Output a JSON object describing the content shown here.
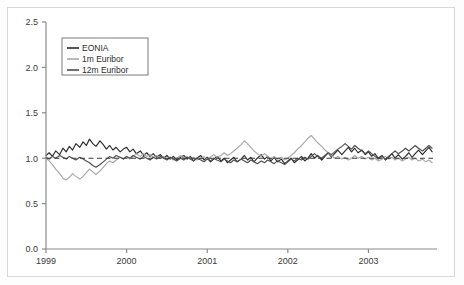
{
  "chart_data": {
    "type": "line",
    "title": "",
    "subtitle": "",
    "xlabel": "",
    "ylabel": "",
    "xlim": [
      1999.0,
      2003.85
    ],
    "ylim": [
      0.0,
      2.5
    ],
    "grid": false,
    "legend_position": "top-left",
    "x_tick_labels": [
      "1999",
      "2000",
      "2001",
      "2002",
      "2003"
    ],
    "x_tick_values": [
      1999,
      2000,
      2001,
      2002,
      2003
    ],
    "y_tick_labels": [
      "0.0",
      "0.5",
      "1.0",
      "1.5",
      "2.0",
      "2.5"
    ],
    "y_tick_values": [
      0.0,
      0.5,
      1.0,
      1.5,
      2.0,
      2.5
    ],
    "reference_line": {
      "name": "unity-reference",
      "value": 1.0,
      "style": "dashed",
      "color": "#3a3a3a"
    },
    "colors": {
      "eonia": "#2b2b2b",
      "euribor_1m": "#a8a8a8",
      "euribor_12m": "#4e4e4e",
      "axis": "#8a8a8a",
      "text": "#3a3a3a",
      "legend_border": "#6e6e6e",
      "frame": "#d8d8d8",
      "background": "#ffffff"
    },
    "series": [
      {
        "name": "EONIA",
        "legend_label": "EONIA",
        "color": "#2b2b2b",
        "x": [
          1999.0,
          1999.04,
          1999.08,
          1999.12,
          1999.17,
          1999.21,
          1999.25,
          1999.29,
          1999.33,
          1999.37,
          1999.42,
          1999.46,
          1999.5,
          1999.54,
          1999.58,
          1999.62,
          1999.67,
          1999.71,
          1999.75,
          1999.79,
          1999.83,
          1999.87,
          1999.92,
          1999.96,
          2000.0,
          2000.04,
          2000.08,
          2000.12,
          2000.17,
          2000.21,
          2000.25,
          2000.29,
          2000.33,
          2000.37,
          2000.42,
          2000.46,
          2000.5,
          2000.54,
          2000.58,
          2000.62,
          2000.67,
          2000.71,
          2000.75,
          2000.79,
          2000.83,
          2000.87,
          2000.92,
          2000.96,
          2001.0,
          2001.04,
          2001.08,
          2001.12,
          2001.17,
          2001.21,
          2001.25,
          2001.29,
          2001.33,
          2001.37,
          2001.42,
          2001.46,
          2001.5,
          2001.54,
          2001.58,
          2001.62,
          2001.67,
          2001.71,
          2001.75,
          2001.79,
          2001.83,
          2001.87,
          2001.92,
          2001.96,
          2002.0,
          2002.04,
          2002.08,
          2002.12,
          2002.17,
          2002.21,
          2002.25,
          2002.29,
          2002.33,
          2002.37,
          2002.42,
          2002.46,
          2002.5,
          2002.54,
          2002.58,
          2002.62,
          2002.67,
          2002.71,
          2002.75,
          2002.79,
          2002.83,
          2002.87,
          2002.92,
          2002.96,
          2003.0,
          2003.04,
          2003.08,
          2003.12,
          2003.17,
          2003.21,
          2003.25,
          2003.29,
          2003.33,
          2003.37,
          2003.42,
          2003.46,
          2003.5,
          2003.54,
          2003.58,
          2003.62,
          2003.67,
          2003.71,
          2003.75,
          2003.79
        ],
        "y": [
          1.03,
          1.06,
          1.02,
          1.08,
          1.04,
          1.11,
          1.07,
          1.13,
          1.09,
          1.16,
          1.12,
          1.18,
          1.14,
          1.21,
          1.16,
          1.13,
          1.19,
          1.15,
          1.1,
          1.14,
          1.09,
          1.12,
          1.07,
          1.1,
          1.12,
          1.07,
          1.1,
          1.05,
          1.08,
          1.03,
          1.06,
          1.02,
          1.05,
          1.01,
          1.04,
          1.0,
          1.03,
          0.99,
          1.02,
          0.98,
          1.01,
          1.03,
          0.99,
          1.02,
          0.97,
          1.0,
          1.03,
          0.98,
          1.01,
          0.96,
          0.99,
          1.02,
          0.97,
          1.0,
          0.95,
          0.98,
          1.01,
          0.96,
          0.99,
          1.03,
          0.98,
          1.01,
          0.96,
          1.0,
          1.04,
          0.99,
          1.02,
          0.97,
          1.01,
          0.96,
          0.99,
          0.94,
          0.97,
          1.0,
          0.95,
          0.98,
          1.02,
          0.97,
          1.0,
          1.05,
          1.0,
          1.03,
          0.98,
          1.02,
          1.06,
          1.01,
          1.05,
          1.09,
          1.04,
          1.08,
          1.12,
          1.07,
          1.11,
          1.06,
          1.09,
          1.04,
          1.07,
          1.02,
          1.05,
          1.0,
          1.03,
          0.98,
          1.01,
          1.05,
          1.0,
          1.04,
          0.99,
          1.02,
          1.06,
          1.01,
          1.05,
          1.09,
          1.04,
          1.08,
          1.12,
          1.07
        ]
      },
      {
        "name": "1m Euribor",
        "legend_label": "1m Euribor",
        "color": "#a8a8a8",
        "x": [
          1999.0,
          1999.04,
          1999.08,
          1999.12,
          1999.17,
          1999.21,
          1999.25,
          1999.29,
          1999.33,
          1999.37,
          1999.42,
          1999.46,
          1999.5,
          1999.54,
          1999.58,
          1999.62,
          1999.67,
          1999.71,
          1999.75,
          1999.79,
          1999.83,
          1999.87,
          1999.92,
          1999.96,
          2000.0,
          2000.04,
          2000.08,
          2000.12,
          2000.17,
          2000.21,
          2000.25,
          2000.29,
          2000.33,
          2000.37,
          2000.42,
          2000.46,
          2000.5,
          2000.54,
          2000.58,
          2000.62,
          2000.67,
          2000.71,
          2000.75,
          2000.79,
          2000.83,
          2000.87,
          2000.92,
          2000.96,
          2001.0,
          2001.04,
          2001.08,
          2001.12,
          2001.17,
          2001.21,
          2001.25,
          2001.29,
          2001.33,
          2001.37,
          2001.42,
          2001.46,
          2001.5,
          2001.54,
          2001.58,
          2001.62,
          2001.67,
          2001.71,
          2001.75,
          2001.79,
          2001.83,
          2001.87,
          2001.92,
          2001.96,
          2002.0,
          2002.04,
          2002.08,
          2002.12,
          2002.17,
          2002.21,
          2002.25,
          2002.29,
          2002.33,
          2002.37,
          2002.42,
          2002.46,
          2002.5,
          2002.54,
          2002.58,
          2002.62,
          2002.67,
          2002.71,
          2002.75,
          2002.79,
          2002.83,
          2002.87,
          2002.92,
          2002.96,
          2003.0,
          2003.04,
          2003.08,
          2003.12,
          2003.17,
          2003.21,
          2003.25,
          2003.29,
          2003.33,
          2003.37,
          2003.42,
          2003.46,
          2003.5,
          2003.54,
          2003.58,
          2003.62,
          2003.67,
          2003.71,
          2003.75,
          2003.79
        ],
        "y": [
          1.0,
          0.97,
          0.93,
          0.88,
          0.83,
          0.78,
          0.76,
          0.79,
          0.83,
          0.8,
          0.77,
          0.8,
          0.84,
          0.88,
          0.85,
          0.82,
          0.86,
          0.9,
          0.94,
          0.97,
          0.95,
          0.98,
          1.01,
          0.99,
          1.02,
          0.99,
          1.02,
          1.05,
          1.02,
          1.05,
          1.02,
          1.04,
          1.01,
          1.03,
          1.0,
          1.02,
          0.99,
          1.01,
          0.98,
          1.0,
          1.03,
          1.0,
          1.02,
          0.99,
          1.01,
          0.98,
          1.0,
          1.02,
          0.99,
          1.01,
          1.04,
          1.01,
          1.03,
          1.06,
          1.03,
          1.05,
          1.08,
          1.11,
          1.15,
          1.19,
          1.16,
          1.12,
          1.08,
          1.05,
          1.02,
          1.05,
          1.02,
          0.99,
          1.02,
          0.99,
          1.01,
          0.98,
          1.0,
          1.03,
          1.06,
          1.1,
          1.14,
          1.18,
          1.22,
          1.25,
          1.21,
          1.17,
          1.13,
          1.09,
          1.06,
          1.03,
          1.0,
          1.02,
          0.99,
          1.01,
          0.98,
          1.0,
          1.03,
          1.0,
          1.02,
          0.99,
          1.01,
          0.98,
          1.0,
          0.97,
          0.99,
          1.02,
          0.99,
          1.01,
          0.98,
          1.0,
          0.97,
          0.99,
          1.01,
          0.98,
          1.0,
          0.97,
          0.99,
          0.96,
          0.98,
          0.95
        ]
      },
      {
        "name": "12m Euribor",
        "legend_label": "12m Euribor",
        "color": "#4e4e4e",
        "x": [
          1999.0,
          1999.04,
          1999.08,
          1999.12,
          1999.17,
          1999.21,
          1999.25,
          1999.29,
          1999.33,
          1999.37,
          1999.42,
          1999.46,
          1999.5,
          1999.54,
          1999.58,
          1999.62,
          1999.67,
          1999.71,
          1999.75,
          1999.79,
          1999.83,
          1999.87,
          1999.92,
          1999.96,
          2000.0,
          2000.04,
          2000.08,
          2000.12,
          2000.17,
          2000.21,
          2000.25,
          2000.29,
          2000.33,
          2000.37,
          2000.42,
          2000.46,
          2000.5,
          2000.54,
          2000.58,
          2000.62,
          2000.67,
          2000.71,
          2000.75,
          2000.79,
          2000.83,
          2000.87,
          2000.92,
          2000.96,
          2001.0,
          2001.04,
          2001.08,
          2001.12,
          2001.17,
          2001.21,
          2001.25,
          2001.29,
          2001.33,
          2001.37,
          2001.42,
          2001.46,
          2001.5,
          2001.54,
          2001.58,
          2001.62,
          2001.67,
          2001.71,
          2001.75,
          2001.79,
          2001.83,
          2001.87,
          2001.92,
          2001.96,
          2002.0,
          2002.04,
          2002.08,
          2002.12,
          2002.17,
          2002.21,
          2002.25,
          2002.29,
          2002.33,
          2002.37,
          2002.42,
          2002.46,
          2002.5,
          2002.54,
          2002.58,
          2002.62,
          2002.67,
          2002.71,
          2002.75,
          2002.79,
          2002.83,
          2002.87,
          2002.92,
          2002.96,
          2003.0,
          2003.04,
          2003.08,
          2003.12,
          2003.17,
          2003.21,
          2003.25,
          2003.29,
          2003.33,
          2003.37,
          2003.42,
          2003.46,
          2003.5,
          2003.54,
          2003.58,
          2003.62,
          2003.67,
          2003.71,
          2003.75,
          2003.79
        ],
        "y": [
          1.01,
          0.99,
          1.02,
          1.0,
          1.03,
          1.01,
          0.99,
          1.02,
          1.0,
          0.98,
          1.01,
          0.99,
          0.97,
          0.95,
          0.92,
          0.9,
          0.93,
          0.96,
          0.99,
          1.02,
          1.0,
          1.03,
          1.01,
          0.99,
          1.02,
          1.0,
          1.03,
          1.01,
          0.99,
          1.02,
          1.0,
          0.98,
          1.01,
          0.99,
          1.02,
          1.0,
          0.98,
          1.01,
          0.99,
          0.97,
          1.0,
          0.98,
          1.01,
          0.99,
          0.97,
          1.0,
          0.98,
          0.96,
          0.99,
          0.97,
          1.0,
          0.98,
          0.96,
          0.99,
          0.97,
          0.95,
          0.98,
          0.96,
          0.99,
          0.97,
          0.95,
          0.98,
          0.96,
          0.94,
          0.97,
          0.95,
          0.98,
          0.96,
          0.94,
          0.97,
          0.95,
          0.93,
          0.96,
          0.99,
          0.97,
          1.0,
          0.98,
          1.01,
          0.99,
          1.02,
          1.05,
          1.02,
          1.0,
          1.03,
          1.06,
          1.04,
          1.07,
          1.1,
          1.13,
          1.16,
          1.13,
          1.1,
          1.14,
          1.11,
          1.08,
          1.05,
          1.08,
          1.05,
          1.02,
          0.99,
          1.02,
          0.99,
          1.02,
          1.05,
          1.08,
          1.05,
          1.08,
          1.11,
          1.08,
          1.11,
          1.14,
          1.11,
          1.08,
          1.11,
          1.14,
          1.11
        ]
      }
    ]
  }
}
